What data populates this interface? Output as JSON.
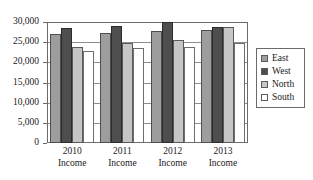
{
  "chart_data": {
    "type": "bar",
    "title": "",
    "subtitle": "",
    "xlabel": "",
    "ylabel": "",
    "categories": [
      "2010 Income",
      "2011 Income",
      "2012 Income",
      "2013 Income"
    ],
    "category_lines": [
      {
        "line1": "2010",
        "line2": "Income"
      },
      {
        "line1": "2011",
        "line2": "Income"
      },
      {
        "line1": "2012",
        "line2": "Income"
      },
      {
        "line1": "2013",
        "line2": "Income"
      }
    ],
    "series": [
      {
        "name": "East",
        "color": "#9d9d9d",
        "values": [
          27000,
          27400,
          27800,
          28000
        ]
      },
      {
        "name": "West",
        "color": "#4e4e4e",
        "values": [
          28500,
          28900,
          30000,
          28700
        ]
      },
      {
        "name": "North",
        "color": "#c6c6c6",
        "values": [
          23900,
          24700,
          25600,
          28700
        ]
      },
      {
        "name": "South",
        "color": "#ffffff",
        "values": [
          22700,
          23500,
          23800,
          24700
        ]
      }
    ],
    "ylim": [
      0,
      30000
    ],
    "ytick_values": [
      0,
      5000,
      10000,
      15000,
      20000,
      25000,
      30000
    ],
    "ytick_labels": [
      "0",
      "5,000",
      "10,000",
      "15,000",
      "20,000",
      "25,000",
      "30,000"
    ],
    "grid": true,
    "legend_position": "right",
    "legend_entries": [
      "East",
      "West",
      "North",
      "South"
    ]
  }
}
